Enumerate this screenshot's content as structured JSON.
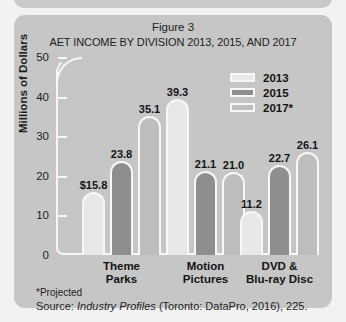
{
  "figure": {
    "label": "Figure 3",
    "title": "AET INCOME BY DIVISION 2013, 2015, AND 2017",
    "footnote": "*Projected",
    "source_prefix": "Source: ",
    "source_italic": "Industry Profiles",
    "source_suffix": " (Toronto: DataPro, 2016), 225.",
    "credit": "© Cengage Learning 2015"
  },
  "colors": {
    "card_background": "#c6c6c6",
    "page_background": "#f2f2f2",
    "series_2013": "#e8e8e8",
    "series_2015": "#8e8e8e",
    "series_2017": "#bdbdbd",
    "outline": "#f7f7f7",
    "text": "#1d1d1d"
  },
  "chart_data": {
    "type": "bar",
    "title": "AET INCOME BY DIVISION 2013, 2015, AND 2017",
    "subtitle": "Figure 3",
    "xlabel": "",
    "ylabel": "Millions of Dollars",
    "ylim": [
      0,
      50
    ],
    "yticks": [
      0,
      10,
      20,
      30,
      40,
      50
    ],
    "ytick_labels": [
      "0",
      "10",
      "20",
      "30",
      "40",
      "50"
    ],
    "grid": false,
    "legend_position": "top-right",
    "categories": [
      "Theme Parks",
      "Motion Pictures",
      "DVD & Blu-ray Disc"
    ],
    "category_lines": [
      [
        "Theme",
        "Parks"
      ],
      [
        "Motion",
        "Pictures"
      ],
      [
        "DVD &",
        "Blu-ray Disc"
      ]
    ],
    "series": [
      {
        "name": "2013",
        "values": [
          15.8,
          39.3,
          11.2
        ],
        "labels": [
          "$15.8",
          "39.3",
          "11.2"
        ]
      },
      {
        "name": "2015",
        "values": [
          23.8,
          21.1,
          22.7
        ],
        "labels": [
          "23.8",
          "21.1",
          "22.7"
        ]
      },
      {
        "name": "2017*",
        "values": [
          35.1,
          21.0,
          26.1
        ],
        "labels": [
          "35.1",
          "21.0",
          "26.1"
        ]
      }
    ]
  }
}
